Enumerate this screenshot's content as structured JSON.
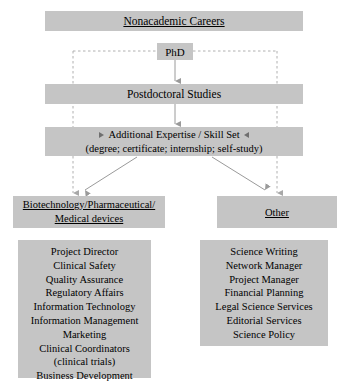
{
  "diagram": {
    "title": "Nonacademic Careers",
    "nodes": {
      "phd": "PhD",
      "postdoc": "Postdoctoral Studies",
      "expertise_line1": "Additional Expertise / Skill Set",
      "expertise_line2": "(degree; certificate; internship; self-study)"
    },
    "branches": [
      {
        "header_lines": [
          "Biotechnology/Pharmaceutical/",
          "Medical devices"
        ],
        "items": [
          "Project Director",
          "Clinical Safety",
          "Quality Assurance",
          "Regulatory Affairs",
          "Information Technology",
          "Information Management",
          "Marketing",
          "Clinical Coordinators",
          "(clinical trials)",
          "Business Development"
        ]
      },
      {
        "header_lines": [
          "Other"
        ],
        "items": [
          "Science Writing",
          "Network Manager",
          "Project Manager",
          "Financial Planning",
          "Legal Science Services",
          "Editorial Services",
          "Science Policy"
        ]
      }
    ],
    "colors": {
      "box_fill": "#c5c5c5",
      "solid_connector": "#9a9a9a",
      "dashed_connector": "#b0b0b0",
      "text": "#000000",
      "background": "#ffffff"
    }
  }
}
